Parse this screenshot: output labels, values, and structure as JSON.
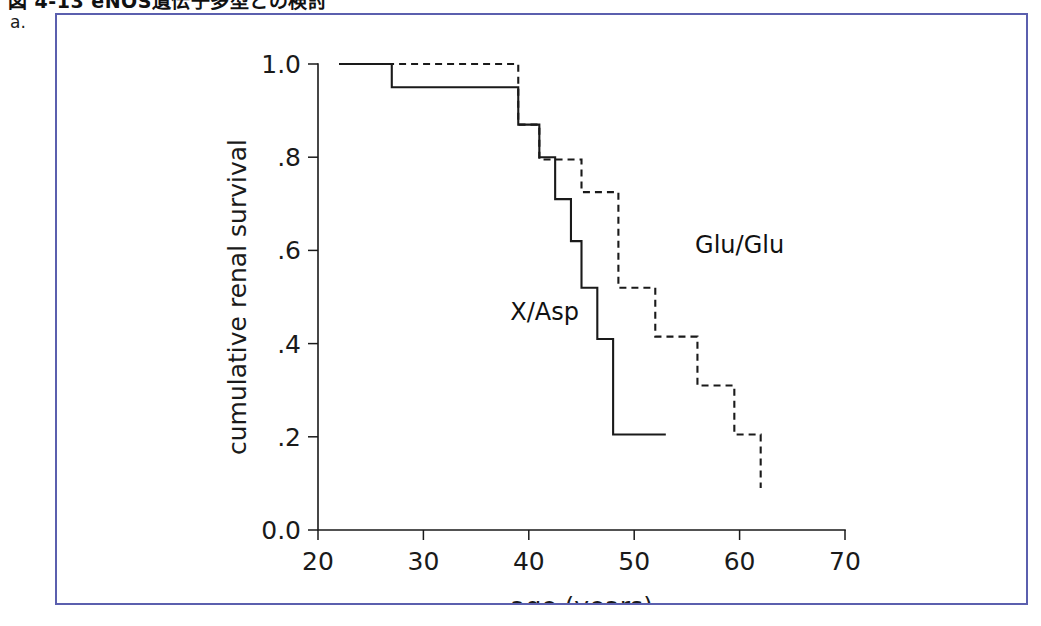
{
  "page": {
    "caption": "図 4-13  eNOS遺伝子多型との検討",
    "panel_letter": "a.",
    "frame_border_color": "#5b5fae",
    "background_color": "#ffffff"
  },
  "chart_data": {
    "type": "line",
    "subtype": "kaplan-meier-step",
    "title": "",
    "xlabel": "age (years)",
    "ylabel": "cumulative renal survival",
    "xlim": [
      20,
      70
    ],
    "ylim": [
      0.0,
      1.0
    ],
    "xticks": [
      20,
      30,
      40,
      50,
      60,
      70
    ],
    "xtick_labels": [
      "20",
      "30",
      "40",
      "50",
      "60",
      "70"
    ],
    "yticks": [
      0.0,
      0.2,
      0.4,
      0.6,
      0.8,
      1.0
    ],
    "ytick_labels": [
      "0.0",
      ".2",
      ".4",
      ".6",
      ".8",
      "1.0"
    ],
    "grid": false,
    "legend_position": "inline-annotation",
    "line_color": "#1a1a1a",
    "series": [
      {
        "name": "X/Asp",
        "style": "solid",
        "label_x": 41.5,
        "label_y": 0.45,
        "x": [
          22,
          27,
          27,
          39,
          39,
          41,
          41,
          42.5,
          42.5,
          44,
          44,
          45,
          45,
          46.5,
          46.5,
          48,
          48,
          53
        ],
        "y": [
          1.0,
          1.0,
          0.95,
          0.95,
          0.87,
          0.87,
          0.8,
          0.8,
          0.71,
          0.71,
          0.62,
          0.62,
          0.52,
          0.52,
          0.41,
          0.41,
          0.205,
          0.205
        ],
        "steps": [
          {
            "age": 22,
            "survival": 1.0
          },
          {
            "age": 27,
            "survival": 0.95
          },
          {
            "age": 39,
            "survival": 0.87
          },
          {
            "age": 41,
            "survival": 0.8
          },
          {
            "age": 42.5,
            "survival": 0.71
          },
          {
            "age": 44,
            "survival": 0.62
          },
          {
            "age": 45,
            "survival": 0.52
          },
          {
            "age": 46.5,
            "survival": 0.41
          },
          {
            "age": 48,
            "survival": 0.205
          },
          {
            "age": 53,
            "survival": 0.205
          }
        ]
      },
      {
        "name": "Glu/Glu",
        "style": "dashed",
        "label_x": 60.0,
        "label_y": 0.595,
        "x": [
          22,
          39,
          39,
          41,
          41,
          45,
          45,
          48.5,
          48.5,
          52,
          52,
          56,
          56,
          59.5,
          59.5,
          62,
          62
        ],
        "y": [
          1.0,
          1.0,
          0.87,
          0.87,
          0.795,
          0.795,
          0.725,
          0.725,
          0.52,
          0.52,
          0.415,
          0.415,
          0.31,
          0.31,
          0.205,
          0.205,
          0.09
        ],
        "steps": [
          {
            "age": 22,
            "survival": 1.0
          },
          {
            "age": 39,
            "survival": 0.87
          },
          {
            "age": 41,
            "survival": 0.795
          },
          {
            "age": 45,
            "survival": 0.725
          },
          {
            "age": 48.5,
            "survival": 0.52
          },
          {
            "age": 52,
            "survival": 0.415
          },
          {
            "age": 56,
            "survival": 0.31
          },
          {
            "age": 59.5,
            "survival": 0.205
          },
          {
            "age": 62,
            "survival": 0.09
          }
        ]
      }
    ]
  }
}
